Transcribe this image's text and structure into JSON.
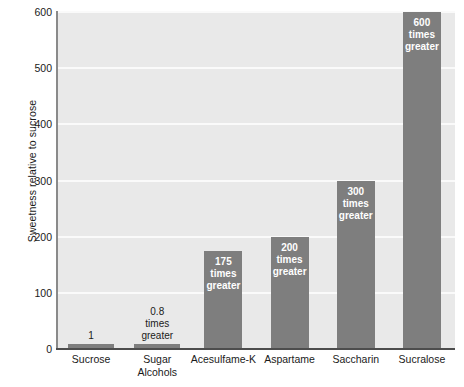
{
  "chart_data": {
    "type": "bar",
    "title": "",
    "subtitle": "",
    "xlabel": "",
    "ylabel": "Sweetness relative to sucrose",
    "categories": [
      "Sucrose",
      "Sugar Alcohols",
      "Acesulfame-K",
      "Aspartame",
      "Saccharin",
      "Sucralose"
    ],
    "values": [
      1,
      0.8,
      175,
      200,
      300,
      600
    ],
    "data_labels": [
      "1",
      "0.8 times greater",
      "175 times greater",
      "200 times greater",
      "300 times greater",
      "600 times greater"
    ],
    "ylim": [
      0,
      600
    ],
    "yticks": [
      0,
      100,
      200,
      300,
      400,
      500,
      600
    ],
    "ytick_labels": [
      "0",
      "100",
      "200",
      "300",
      "400",
      "500",
      "600"
    ],
    "grid": true,
    "legend": "none",
    "bar_color": "#7e7e7e",
    "plot_background": "#e9e9e9",
    "gridline_color": "#fafafa",
    "figure_background": "#ffffff"
  },
  "bars": [
    {
      "category": "Sucrose",
      "category_line1": "Sucrose",
      "category_line2": "",
      "value": 1,
      "label_line1": "1",
      "label_line2": "",
      "label_line3": "",
      "label_position": "outside"
    },
    {
      "category": "Sugar Alcohols",
      "category_line1": "Sugar",
      "category_line2": "Alcohols",
      "value": 0.8,
      "label_line1": "0.8",
      "label_line2": "times",
      "label_line3": "greater",
      "label_position": "outside"
    },
    {
      "category": "Acesulfame-K",
      "category_line1": "Acesulfame-K",
      "category_line2": "",
      "value": 175,
      "label_line1": "175",
      "label_line2": "times",
      "label_line3": "greater",
      "label_position": "inside"
    },
    {
      "category": "Aspartame",
      "category_line1": "Aspartame",
      "category_line2": "",
      "value": 200,
      "label_line1": "200",
      "label_line2": "times",
      "label_line3": "greater",
      "label_position": "inside"
    },
    {
      "category": "Saccharin",
      "category_line1": "Saccharin",
      "category_line2": "",
      "value": 300,
      "label_line1": "300",
      "label_line2": "times",
      "label_line3": "greater",
      "label_position": "inside"
    },
    {
      "category": "Sucralose",
      "category_line1": "Sucralose",
      "category_line2": "",
      "value": 600,
      "label_line1": "600",
      "label_line2": "times",
      "label_line3": "greater",
      "label_position": "inside"
    }
  ],
  "axis": {
    "y_title": "Sweetness relative to sucrose",
    "y_tick_labels": [
      "600",
      "500",
      "400",
      "300",
      "200",
      "100",
      "0"
    ]
  }
}
